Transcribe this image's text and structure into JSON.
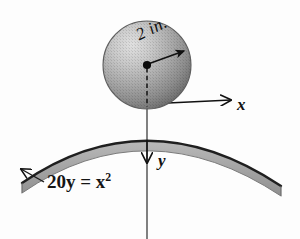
{
  "figure": {
    "background_color": "#fdfdfd",
    "ink_color": "#111111"
  },
  "sphere": {
    "name": "sphere",
    "center_x": 147,
    "center_y": 65,
    "radius_px": 44,
    "fill_light": "#d2d2d2",
    "fill_dark": "#787878",
    "edge_color": "#5a5a5a"
  },
  "dimension": {
    "radius_label": "2 in.",
    "arrow_from": [
      147,
      65
    ],
    "arrow_to": [
      186,
      51
    ]
  },
  "axes": {
    "origin": [
      147,
      107
    ],
    "x_label": "x",
    "y_label": "y",
    "x_arrow_to": [
      231,
      100
    ],
    "y_arrow_to": [
      147,
      163
    ],
    "axis_color": "#1a1a1a"
  },
  "curve": {
    "equation_text": "20y = x",
    "equation_exponent": "2",
    "equation_full": "20y = x²",
    "band_color": "#a8a8a8",
    "line_color": "#1f1f1f",
    "left_end": [
      22,
      183
    ],
    "right_end": [
      281,
      186
    ],
    "apex": [
      147,
      107
    ]
  },
  "leader": {
    "name": "equation-leader-line",
    "from": [
      44,
      182
    ],
    "to": [
      20,
      168
    ]
  },
  "centerline": {
    "style": "dashed",
    "from": [
      147,
      67
    ],
    "to": [
      147,
      107
    ]
  }
}
